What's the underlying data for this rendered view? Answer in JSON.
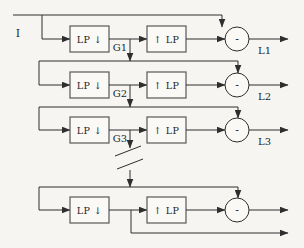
{
  "diagram": {
    "input_label": "I",
    "levels": [
      {
        "downsample_label": "LP ↓",
        "upsample_label": "↑ LP",
        "operator": "-",
        "gaussian_label": "G1",
        "laplacian_label": "L1"
      },
      {
        "downsample_label": "LP ↓",
        "upsample_label": "↑ LP",
        "operator": "-",
        "gaussian_label": "G2",
        "laplacian_label": "L2"
      },
      {
        "downsample_label": "LP ↓",
        "upsample_label": "↑ LP",
        "operator": "-",
        "gaussian_label": "G3",
        "laplacian_label": "L3"
      },
      {
        "downsample_label": "LP ↓",
        "upsample_label": "↑ LP",
        "operator": "-"
      }
    ],
    "colors": {
      "background": "#f6f5f2",
      "line": "#2e2e2e",
      "box_border": "#585858",
      "text": "#1f1f1f"
    }
  }
}
